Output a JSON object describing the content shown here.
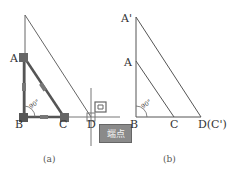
{
  "figure_a": {
    "caption": "(a)",
    "labels": {
      "A": "A",
      "B": "B",
      "C": "C",
      "D": "D"
    },
    "angle_label": "90°",
    "tooltip": "端点",
    "snap_icon": "endpoint-snap-icon"
  },
  "figure_b": {
    "caption": "(b)",
    "labels": {
      "A_prime": "A'",
      "A": "A",
      "B": "B",
      "C": "C",
      "D": "D(C')"
    },
    "angle_label": "90°"
  },
  "colors": {
    "line": "#555555",
    "grip": "#666666",
    "tooltip_bg": "#8a8a8a"
  }
}
